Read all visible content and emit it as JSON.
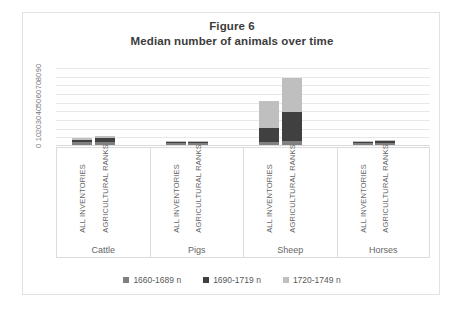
{
  "figure": {
    "title_line1": "Figure 6",
    "title_line2": "Median number of animals over time"
  },
  "colors": {
    "series1": "#808080",
    "series2": "#404040",
    "series3": "#bfbfbf",
    "gridline": "#e8e8e8",
    "text": "#666666",
    "title_text": "#3c3c3c",
    "frame": "#e2e2e2"
  },
  "chart_data": {
    "type": "bar",
    "subtitle": "Median number of animals over time",
    "stacked": true,
    "xlabel": "",
    "ylabel": "",
    "ylim": [
      0,
      90
    ],
    "yticks": [
      90,
      80,
      70,
      60,
      50,
      40,
      30,
      20,
      10,
      0
    ],
    "grid": true,
    "legend_position": "bottom",
    "groups": [
      "Cattle",
      "Pigs",
      "Sheep",
      "Horses"
    ],
    "subcategories": [
      "ALL INVENTORIES",
      "AGRICULTURAL RANKS"
    ],
    "categories": [
      "Cattle / ALL INVENTORIES",
      "Cattle / AGRICULTURAL RANKS",
      "Pigs / ALL INVENTORIES",
      "Pigs / AGRICULTURAL RANKS",
      "Sheep / ALL INVENTORIES",
      "Sheep / AGRICULTURAL RANKS",
      "Horses / ALL INVENTORIES",
      "Horses / AGRICULTURAL RANKS"
    ],
    "series": [
      {
        "name": "1660-1689 n",
        "color": "#808080",
        "values": [
          3,
          4,
          2,
          2,
          4,
          5,
          2,
          2
        ]
      },
      {
        "name": "1690-1719 n",
        "color": "#404040",
        "values": [
          3,
          4,
          2,
          2,
          16,
          33,
          2,
          3
        ]
      },
      {
        "name": "1720-1749 n",
        "color": "#bfbfbf",
        "values": [
          2,
          3,
          1,
          1,
          31,
          39,
          1,
          1
        ]
      }
    ],
    "totals": [
      8,
      11,
      5,
      5,
      51,
      77,
      5,
      6
    ]
  },
  "legend": {
    "items": [
      {
        "label": "1660-1689 n",
        "color": "#808080"
      },
      {
        "label": "1690-1719 n",
        "color": "#404040"
      },
      {
        "label": "1720-1749 n",
        "color": "#bfbfbf"
      }
    ]
  },
  "axis": {
    "yticks": [
      "90",
      "80",
      "70",
      "60",
      "50",
      "40",
      "30",
      "20",
      "10",
      "0"
    ]
  },
  "groups": [
    {
      "name": "Cattle",
      "sub1": "ALL INVENTORIES",
      "sub2": "AGRICULTURAL RANKS"
    },
    {
      "name": "Pigs",
      "sub1": "ALL INVENTORIES",
      "sub2": "AGRICULTURAL RANKS"
    },
    {
      "name": "Sheep",
      "sub1": "ALL INVENTORIES",
      "sub2": "AGRICULTURAL RANKS"
    },
    {
      "name": "Horses",
      "sub1": "ALL INVENTORIES",
      "sub2": "AGRICULTURAL RANKS"
    }
  ]
}
